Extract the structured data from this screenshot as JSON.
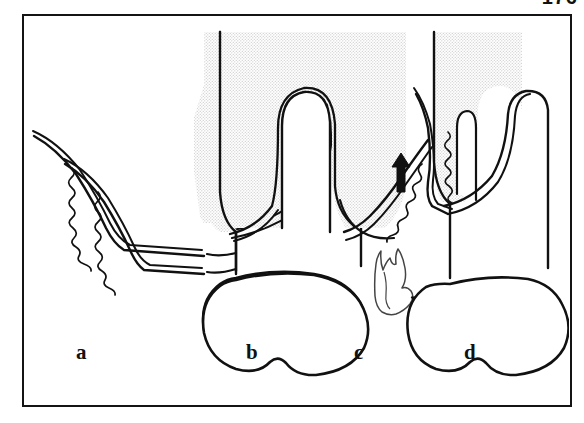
{
  "page": {
    "folio": "176",
    "figure_caption": "",
    "background_color": "#ffffff",
    "frame_color": "#141414"
  },
  "figure": {
    "type": "line-drawing",
    "ink_color": "#111111",
    "gingiva_fill": "#e6e6e6",
    "tooth_fill": "#ffffff",
    "panels": [
      {
        "id": "a",
        "label": "a",
        "label_x": 52,
        "label_y": 343,
        "description": "Curette inserted into gingival sulcus against root surface",
        "has_instrument_left": true,
        "has_instrument_right": false,
        "has_calculus_fragment": false,
        "has_arrow_up": false,
        "has_arrow_down": false
      },
      {
        "id": "b",
        "label": "b",
        "label_x": 222,
        "label_y": 343,
        "description": "Curette working subgingivally on mesial aspect",
        "has_instrument_left": true,
        "has_instrument_right": false,
        "has_calculus_fragment": false,
        "has_arrow_up": false,
        "has_arrow_down": false
      },
      {
        "id": "c",
        "label": "c",
        "label_x": 330,
        "label_y": 343,
        "description": "Curette on distal aspect; dislodged calculus fragment removed",
        "has_instrument_left": false,
        "has_instrument_right": true,
        "has_calculus_fragment": true,
        "has_arrow_up": false,
        "has_arrow_down": true
      },
      {
        "id": "d",
        "label": "d",
        "label_x": 440,
        "label_y": 343,
        "description": "Upward working stroke of the curette along the root",
        "has_instrument_left": true,
        "has_instrument_right": false,
        "has_calculus_fragment": false,
        "has_arrow_up": true,
        "has_arrow_down": false
      }
    ],
    "arrows": [
      {
        "name": "arrow-down-right",
        "panel": "c",
        "direction": "down-right",
        "color": "#111111"
      },
      {
        "name": "arrow-up",
        "panel": "d",
        "direction": "up",
        "color": "#111111"
      }
    ],
    "calculus_fragment": {
      "panel": "c",
      "name": "calculus-fragment",
      "outline_color": "#333333",
      "fill": "#ffffff"
    }
  }
}
